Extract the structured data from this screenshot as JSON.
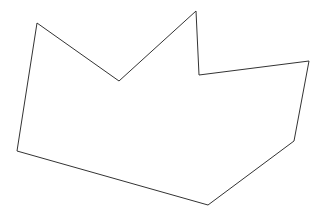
{
  "diagram": {
    "type": "polygon-outline",
    "background": "#ffffff",
    "stroke": "#333333",
    "stroke_width": 1,
    "points": [
      [
        37,
        23
      ],
      [
        119,
        81
      ],
      [
        196,
        11
      ],
      [
        199,
        75
      ],
      [
        309,
        61
      ],
      [
        294,
        141
      ],
      [
        208,
        205
      ],
      [
        17,
        151
      ]
    ]
  }
}
